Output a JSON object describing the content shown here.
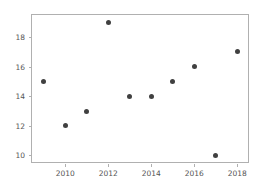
{
  "chart_data": {
    "type": "scatter",
    "title": "",
    "xlabel": "",
    "ylabel": "",
    "x": [
      2009,
      2010,
      2011,
      2012,
      2013,
      2014,
      2015,
      2016,
      2017,
      2018
    ],
    "values": [
      15,
      12,
      13,
      19,
      14,
      14,
      15,
      16,
      10,
      17
    ],
    "series": [
      {
        "name": "",
        "points": [
          {
            "x": 2009,
            "y": 15
          },
          {
            "x": 2010,
            "y": 12
          },
          {
            "x": 2011,
            "y": 13
          },
          {
            "x": 2012,
            "y": 19
          },
          {
            "x": 2013,
            "y": 14
          },
          {
            "x": 2014,
            "y": 14
          },
          {
            "x": 2015,
            "y": 15
          },
          {
            "x": 2016,
            "y": 16
          },
          {
            "x": 2017,
            "y": 10
          },
          {
            "x": 2018,
            "y": 17
          }
        ]
      }
    ],
    "xlim": [
      2008.45,
      2018.5
    ],
    "ylim": [
      9.55,
      19.5
    ],
    "xticks": [
      2010,
      2012,
      2014,
      2016,
      2018
    ],
    "xtick_labels": [
      "2010",
      "2012",
      "2014",
      "2016",
      "2018"
    ],
    "yticks": [
      10,
      12,
      14,
      16,
      18
    ],
    "ytick_labels": [
      "10",
      "12",
      "14",
      "16",
      "18"
    ],
    "grid": false,
    "legend": null,
    "marker_color": "#404040",
    "axes_color": "#b0b0b0",
    "tick_label_color": "#555555",
    "background_color": "#ffffff"
  }
}
